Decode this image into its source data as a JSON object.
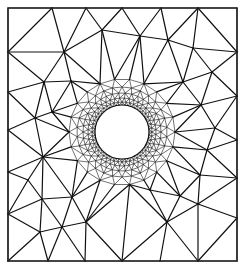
{
  "diagram": {
    "type": "triangular-mesh",
    "colors": {
      "background": "#ffffff",
      "lines": "#111111"
    },
    "domain_box": {
      "x": 8,
      "y": 8,
      "width": 229,
      "height": 253
    },
    "hole": {
      "cx": 122,
      "cy": 132,
      "r": 27
    },
    "refinement_rings": [
      {
        "r": 30,
        "segments": 48
      },
      {
        "r": 34,
        "segments": 44
      },
      {
        "r": 39,
        "segments": 38
      },
      {
        "r": 45,
        "segments": 30
      },
      {
        "r": 53,
        "segments": 22
      }
    ],
    "outer_nodes": [
      [
        8,
        8
      ],
      [
        52,
        8
      ],
      [
        86,
        8
      ],
      [
        122,
        8
      ],
      [
        161,
        8
      ],
      [
        198,
        8
      ],
      [
        237,
        8
      ],
      [
        8,
        52
      ],
      [
        8,
        92
      ],
      [
        8,
        130
      ],
      [
        8,
        172
      ],
      [
        8,
        214
      ],
      [
        8,
        261
      ],
      [
        237,
        52
      ],
      [
        237,
        96
      ],
      [
        237,
        140
      ],
      [
        237,
        178
      ],
      [
        237,
        218
      ],
      [
        237,
        261
      ],
      [
        48,
        261
      ],
      [
        85,
        261
      ],
      [
        122,
        261
      ],
      [
        160,
        261
      ],
      [
        198,
        261
      ],
      [
        64,
        52
      ],
      [
        44,
        82
      ],
      [
        71,
        81
      ],
      [
        52,
        112
      ],
      [
        35,
        118
      ],
      [
        43,
        157
      ],
      [
        28,
        180
      ],
      [
        42,
        199
      ],
      [
        72,
        197
      ],
      [
        40,
        232
      ],
      [
        62,
        227
      ],
      [
        86,
        222
      ],
      [
        102,
        30
      ],
      [
        140,
        36
      ],
      [
        168,
        40
      ],
      [
        193,
        48
      ],
      [
        212,
        72
      ],
      [
        183,
        82
      ],
      [
        201,
        105
      ],
      [
        215,
        128
      ],
      [
        207,
        150
      ],
      [
        200,
        175
      ],
      [
        180,
        196
      ],
      [
        167,
        222
      ],
      [
        198,
        204
      ],
      [
        150,
        190
      ]
    ]
  }
}
